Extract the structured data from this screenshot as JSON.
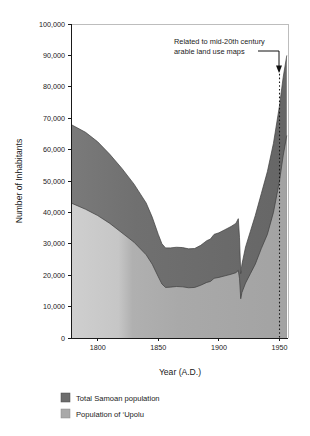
{
  "chart_data": {
    "type": "area",
    "title": "",
    "xlabel": "Year (A.D.)",
    "ylabel": "Number of Inhabitants",
    "xlim": [
      1778,
      1957
    ],
    "ylim": [
      0,
      100000
    ],
    "grid": false,
    "legend_position": "bottom-left",
    "x_ticks": [
      1800,
      1850,
      1900,
      1950
    ],
    "x_tick_labels": [
      "1800",
      "1850",
      "1900",
      "1950"
    ],
    "y_ticks": [
      0,
      10000,
      20000,
      30000,
      40000,
      50000,
      60000,
      70000,
      80000,
      90000,
      100000
    ],
    "y_tick_labels": [
      "0",
      "10,000",
      "20,000",
      "30,000",
      "40,000",
      "50,000",
      "60,000",
      "70,000",
      "80,000",
      "90,000",
      "100,000"
    ],
    "x": [
      1778,
      1790,
      1800,
      1810,
      1820,
      1830,
      1840,
      1845,
      1850,
      1853,
      1856,
      1860,
      1865,
      1870,
      1875,
      1880,
      1885,
      1890,
      1893,
      1896,
      1900,
      1905,
      1910,
      1914,
      1916,
      1917,
      1918,
      1919,
      1922,
      1926,
      1930,
      1935,
      1940,
      1945,
      1950,
      1953,
      1956
    ],
    "series": [
      {
        "name": "Total Samoan population",
        "color": "#6d6d6d",
        "values": [
          68000,
          65500,
          62500,
          58500,
          54000,
          49000,
          43000,
          38500,
          33000,
          30000,
          28700,
          28700,
          28900,
          28800,
          28400,
          28500,
          29500,
          31000,
          31500,
          33000,
          33500,
          34500,
          35500,
          36500,
          38000,
          32000,
          20500,
          23500,
          29000,
          34000,
          39000,
          46000,
          53000,
          62000,
          74000,
          83000,
          90000
        ]
      },
      {
        "name": "Population of 'Upolu",
        "color": "#a9a9a9",
        "values": [
          43000,
          41000,
          39000,
          36500,
          33500,
          30500,
          26500,
          23500,
          19500,
          17200,
          16100,
          16200,
          16400,
          16300,
          16000,
          16100,
          16800,
          17700,
          18000,
          19000,
          19300,
          19800,
          20300,
          20800,
          21500,
          19000,
          12500,
          14500,
          17500,
          20500,
          23500,
          28500,
          33000,
          40000,
          50000,
          58000,
          64500
        ]
      }
    ],
    "annotations": [
      {
        "name": "arable-land-note",
        "text_line1": "Related to mid-20th century",
        "text_line2": "arable land use maps",
        "points_to_year": 1950,
        "marker": "dotted-vertical-line-with-arrow"
      }
    ],
    "gradient_note": {
      "description": "Light series shaded lighter before ~1830, darker after",
      "transition_year": 1830
    }
  },
  "legend": {
    "items": [
      {
        "label": "Total Samoan population",
        "color": "#6d6d6d",
        "name": "legend-total-samoan"
      },
      {
        "label": "Population of ‘Upolu",
        "color": "#a9a9a9",
        "name": "legend-upolu"
      }
    ]
  },
  "colors": {
    "total_dark": "#6d6d6d",
    "upolu_light": "#a9a9a9",
    "upolu_light_early": "#c2c2c2",
    "axis": "#1a1a1a",
    "frame": "#bdbdbd",
    "background": "#ffffff"
  }
}
